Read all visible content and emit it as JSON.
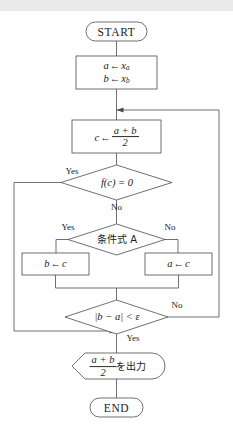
{
  "diagram": {
    "colors": {
      "stroke": "#4b4b4b",
      "text": "#1b1b1b",
      "background": "#ffffff",
      "topband": "#eaeaea"
    },
    "nodes": {
      "start": {
        "shape": "terminator",
        "label": "START"
      },
      "init": {
        "shape": "process",
        "line1_var": "a",
        "line1_arrow": "←",
        "line1_val": "x",
        "line1_sub": "a",
        "line2_var": "b",
        "line2_arrow": "←",
        "line2_val": "x",
        "line2_sub": "b"
      },
      "midpoint": {
        "shape": "process",
        "var": "c",
        "arrow": "←",
        "numerator": "a + b",
        "denominator": "2"
      },
      "check_root": {
        "shape": "decision",
        "label": "f(c) = 0",
        "yes": "Yes",
        "no": "No"
      },
      "condition_a": {
        "shape": "decision",
        "label": "条件式 A",
        "yes": "Yes",
        "no": "No"
      },
      "assign_b": {
        "shape": "process",
        "var": "b",
        "arrow": "←",
        "val": "c"
      },
      "assign_a": {
        "shape": "process",
        "var": "a",
        "arrow": "←",
        "val": "c"
      },
      "check_tol": {
        "shape": "decision",
        "label": "|b − a| < ε",
        "yes": "Yes",
        "no": "No"
      },
      "output": {
        "shape": "display",
        "numerator": "a + b",
        "denominator": "2",
        "suffix": "を出力"
      },
      "end": {
        "shape": "terminator",
        "label": "END"
      }
    }
  }
}
